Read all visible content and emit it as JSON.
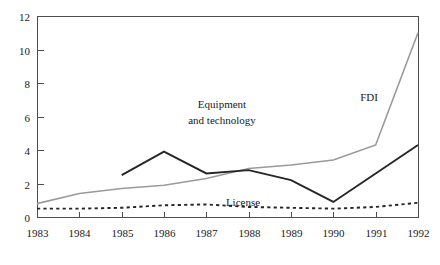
{
  "chart_data": {
    "type": "line",
    "title": "",
    "subtitle": "",
    "xlabel": "",
    "ylabel": "",
    "x": [
      1983,
      1984,
      1985,
      1986,
      1987,
      1988,
      1989,
      1990,
      1991,
      1992
    ],
    "categories": [
      "1983",
      "1984",
      "1985",
      "1986",
      "1987",
      "1988",
      "1989",
      "1990",
      "1991",
      "1992"
    ],
    "xlim": [
      1983,
      1992
    ],
    "ylim": [
      0,
      12
    ],
    "y_ticks": [
      0,
      2,
      4,
      6,
      8,
      10,
      12
    ],
    "y_tick_labels": [
      "0",
      "2",
      "4",
      "6",
      "8",
      "10",
      "12"
    ],
    "x_ticks": [
      1983,
      1984,
      1985,
      1986,
      1987,
      1988,
      1989,
      1990,
      1991,
      1992
    ],
    "x_tick_labels": [
      "1983",
      "1984",
      "1985",
      "1986",
      "1987",
      "1988",
      "1989",
      "1990",
      "1991",
      "1992"
    ],
    "grid": false,
    "legend_position": "inline-annotations",
    "series": [
      {
        "name": "FDI",
        "style": "solid",
        "color": "#9a9a9a",
        "width": 1.6,
        "x": [
          1983,
          1984,
          1985,
          1986,
          1987,
          1988,
          1989,
          1990,
          1991,
          1992
        ],
        "values": [
          0.8,
          1.4,
          1.7,
          1.9,
          2.3,
          2.9,
          3.1,
          3.4,
          4.3,
          11.0
        ]
      },
      {
        "name": "Equipment and technology",
        "style": "solid",
        "color": "#262626",
        "width": 1.9,
        "x": [
          1985,
          1986,
          1987,
          1988,
          1989,
          1990,
          1991,
          1992
        ],
        "values": [
          2.5,
          3.9,
          2.6,
          2.8,
          2.2,
          0.9,
          2.6,
          4.3
        ]
      },
      {
        "name": "License",
        "style": "dotted",
        "color": "#262626",
        "width": 1.9,
        "x": [
          1983,
          1984,
          1985,
          1986,
          1987,
          1988,
          1989,
          1990,
          1991,
          1992
        ],
        "values": [
          0.5,
          0.5,
          0.55,
          0.7,
          0.75,
          0.6,
          0.55,
          0.5,
          0.6,
          0.85
        ]
      }
    ],
    "annotations": [
      {
        "text": "Equipment",
        "x_px": 222,
        "y_px": 108
      },
      {
        "text": "and technology",
        "x_px": 222,
        "y_px": 124
      },
      {
        "text": "FDI",
        "x_px": 369,
        "y_px": 101
      },
      {
        "text": "License",
        "x_px": 243,
        "y_px": 206
      }
    ],
    "frame": {
      "left_px": 37,
      "right_px": 418,
      "top_px": 16,
      "bottom_px": 217
    }
  }
}
